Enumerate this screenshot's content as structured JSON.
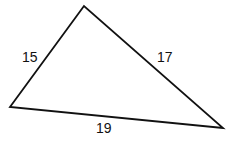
{
  "diagram": {
    "type": "triangle",
    "vertices": {
      "top": [
        84,
        6
      ],
      "left": [
        10,
        107
      ],
      "right": [
        223,
        128
      ]
    },
    "sides": [
      {
        "name": "left-side",
        "label": "15",
        "x": 22,
        "y": 62
      },
      {
        "name": "right-side",
        "label": "17",
        "x": 157,
        "y": 62
      },
      {
        "name": "bottom-side",
        "label": "19",
        "x": 96,
        "y": 133
      }
    ],
    "stroke_color": "#111111",
    "background": "#ffffff"
  }
}
